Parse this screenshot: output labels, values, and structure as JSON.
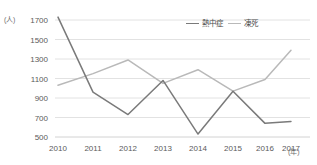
{
  "chart_data": {
    "type": "line",
    "title": "",
    "xlabel": "(年)",
    "ylabel": "(人)",
    "x": [
      2010,
      2011,
      2012,
      2013,
      2014,
      2015,
      2016,
      2017
    ],
    "categories": [
      "2010",
      "2011",
      "2012",
      "2013",
      "2014",
      "2015",
      "2016",
      "2017"
    ],
    "ylim": [
      500,
      1700
    ],
    "ytick_values": [
      500,
      700,
      900,
      1100,
      1300,
      1500,
      1700
    ],
    "ytick_labels": [
      "500",
      "700",
      "900",
      "1100",
      "1300",
      "1500",
      "1700"
    ],
    "grid": true,
    "legend_position": "top-right",
    "series": [
      {
        "name": "熱中症",
        "color": "#7a7a7a",
        "values": [
          1730,
          960,
          730,
          1080,
          530,
          970,
          640,
          660
        ]
      },
      {
        "name": "凍死",
        "color": "#b9b9b9",
        "values": [
          1030,
          1150,
          1290,
          1050,
          1190,
          970,
          1090,
          1390
        ]
      }
    ]
  },
  "axis": {
    "y_unit": "(人)",
    "x_unit": "(年)"
  },
  "colors": {
    "grid": "#e2e2e2",
    "axis_text": "#5a5a5a",
    "series_heatstroke": "#7a7a7a",
    "series_freezing": "#b9b9b9"
  }
}
